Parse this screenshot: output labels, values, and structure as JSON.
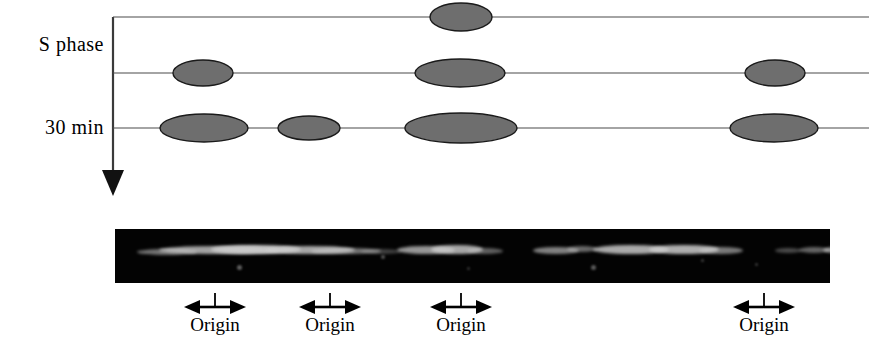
{
  "figure": {
    "width": 869,
    "height": 357,
    "background": "#ffffff",
    "type": "two-dimensional-gel-replication-bubble-diagram"
  },
  "axis": {
    "orientation": "vertical",
    "direction": "downward",
    "meaning": "time progression through S phase",
    "x": 113,
    "y_start": 17,
    "y_end": 196,
    "color": "#3a3a3a"
  },
  "row_labels": [
    {
      "id": "s-phase",
      "text": "S phase",
      "row": 0
    },
    {
      "id": "30-min",
      "text": "30 min",
      "row": 2
    }
  ],
  "schematic": {
    "line_color": "#4a4a4a",
    "line_width": 1.2,
    "bubble_fill": "#6e6e6e",
    "bubble_stroke": "#1a1a1a",
    "x_start": 113,
    "x_end": 869,
    "rows": [
      {
        "label": "S phase",
        "y": 17,
        "bubbles": [
          {
            "cx": 461,
            "rx": 31,
            "ry": 14
          }
        ]
      },
      {
        "label": "",
        "y": 73,
        "bubbles": [
          {
            "cx": 203,
            "rx": 30,
            "ry": 13
          },
          {
            "cx": 460,
            "rx": 45,
            "ry": 14
          },
          {
            "cx": 775,
            "rx": 30,
            "ry": 13
          }
        ]
      },
      {
        "label": "30 min",
        "y": 128,
        "bubbles": [
          {
            "cx": 204,
            "rx": 44,
            "ry": 14
          },
          {
            "cx": 309,
            "rx": 31,
            "ry": 12
          },
          {
            "cx": 461,
            "rx": 56,
            "ry": 15
          },
          {
            "cx": 774,
            "rx": 44,
            "ry": 14
          }
        ]
      }
    ]
  },
  "gel": {
    "description": "autoradiograph of two-dimensional gel",
    "left": 115,
    "top": 229,
    "width": 715,
    "height": 54,
    "background": "#030303",
    "band_color": "#cfcfcf",
    "bands": [
      {
        "x": 22,
        "y": 20,
        "w": 60,
        "h": 6,
        "opacity": 0.55
      },
      {
        "x": 44,
        "y": 17,
        "w": 120,
        "h": 8,
        "opacity": 0.78
      },
      {
        "x": 96,
        "y": 16,
        "w": 90,
        "h": 9,
        "opacity": 0.88
      },
      {
        "x": 150,
        "y": 17,
        "w": 90,
        "h": 8,
        "opacity": 0.8
      },
      {
        "x": 196,
        "y": 19,
        "w": 70,
        "h": 6,
        "opacity": 0.55
      },
      {
        "x": 246,
        "y": 20,
        "w": 40,
        "h": 5,
        "opacity": 0.3
      },
      {
        "x": 282,
        "y": 17,
        "w": 58,
        "h": 8,
        "opacity": 0.72
      },
      {
        "x": 316,
        "y": 16,
        "w": 52,
        "h": 9,
        "opacity": 0.8
      },
      {
        "x": 352,
        "y": 19,
        "w": 36,
        "h": 6,
        "opacity": 0.45
      },
      {
        "x": 418,
        "y": 18,
        "w": 46,
        "h": 7,
        "opacity": 0.62
      },
      {
        "x": 452,
        "y": 17,
        "w": 30,
        "h": 6,
        "opacity": 0.5
      },
      {
        "x": 478,
        "y": 16,
        "w": 76,
        "h": 9,
        "opacity": 0.82
      },
      {
        "x": 534,
        "y": 16,
        "w": 70,
        "h": 9,
        "opacity": 0.84
      },
      {
        "x": 584,
        "y": 18,
        "w": 44,
        "h": 7,
        "opacity": 0.58
      },
      {
        "x": 660,
        "y": 19,
        "w": 26,
        "h": 5,
        "opacity": 0.35
      },
      {
        "x": 684,
        "y": 18,
        "w": 30,
        "h": 6,
        "opacity": 0.48
      },
      {
        "x": 708,
        "y": 17,
        "w": 56,
        "h": 8,
        "opacity": 0.72
      },
      {
        "x": 744,
        "y": 16,
        "w": 80,
        "h": 9,
        "opacity": 0.85
      },
      {
        "x": 800,
        "y": 17,
        "w": 48,
        "h": 7,
        "opacity": 0.62
      }
    ],
    "specks": [
      {
        "x": 122,
        "y": 36,
        "w": 5,
        "h": 5,
        "opacity": 0.45
      },
      {
        "x": 266,
        "y": 26,
        "w": 4,
        "h": 4,
        "opacity": 0.4
      },
      {
        "x": 476,
        "y": 36,
        "w": 5,
        "h": 5,
        "opacity": 0.42
      },
      {
        "x": 586,
        "y": 30,
        "w": 3,
        "h": 3,
        "opacity": 0.3
      },
      {
        "x": 352,
        "y": 38,
        "w": 3,
        "h": 3,
        "opacity": 0.25
      },
      {
        "x": 640,
        "y": 34,
        "w": 3,
        "h": 3,
        "opacity": 0.28
      }
    ]
  },
  "origin_markers": [
    {
      "id": "origin-1",
      "label": "Origin",
      "center_x": 215,
      "top": 290
    },
    {
      "id": "origin-2",
      "label": "Origin",
      "center_x": 330,
      "top": 290
    },
    {
      "id": "origin-3",
      "label": "Origin",
      "center_x": 461,
      "top": 290
    },
    {
      "id": "origin-4",
      "label": "Origin",
      "center_x": 764,
      "top": 290
    }
  ],
  "marker_style": {
    "arrow_color": "#000000",
    "tick_color": "#000000",
    "description": "double-headed horizontal arrow with upward vertical tick at center"
  }
}
